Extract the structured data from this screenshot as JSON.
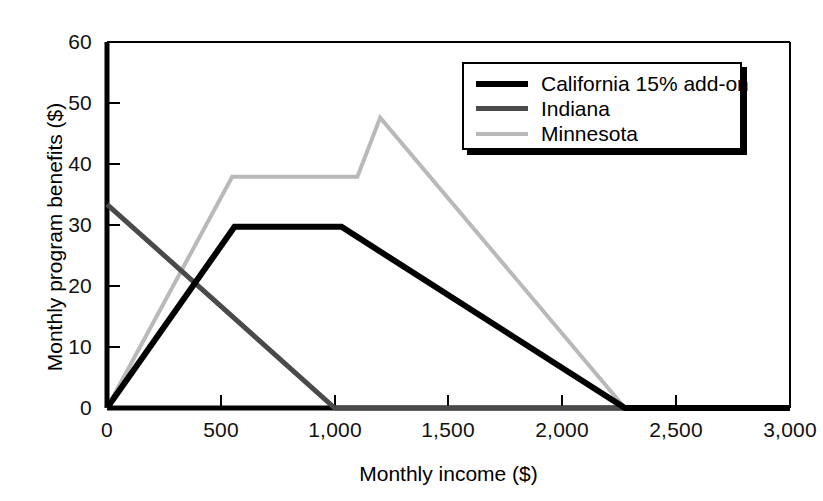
{
  "chart_data": {
    "type": "line",
    "title": "",
    "xlabel": "Monthly income ($)",
    "ylabel": "Monthly program benefits ($)",
    "xlim": [
      0,
      3000
    ],
    "ylim": [
      0,
      60
    ],
    "xticks": [
      0,
      500,
      1000,
      1500,
      2000,
      2500,
      3000
    ],
    "xtick_labels": [
      "0",
      "500",
      "1,000",
      "1,500",
      "2,000",
      "2,500",
      "3,000"
    ],
    "yticks": [
      0,
      10,
      20,
      30,
      40,
      50,
      60
    ],
    "ytick_labels": [
      "0",
      "10",
      "20",
      "30",
      "40",
      "50",
      "60"
    ],
    "grid": false,
    "legend_position": "upper right",
    "series": [
      {
        "name": "California 15% add-on",
        "color": "#000000",
        "width": 6,
        "x": [
          0,
          560,
          1030,
          2275,
          3000
        ],
        "y": [
          0,
          29.7,
          29.7,
          0,
          0
        ]
      },
      {
        "name": "Indiana",
        "color": "#4a4a4a",
        "width": 5,
        "x": [
          0,
          1000,
          3000
        ],
        "y": [
          33.4,
          0,
          0
        ]
      },
      {
        "name": "Minnesota",
        "color": "#b9b9b9",
        "width": 4,
        "x": [
          0,
          550,
          1100,
          1200,
          2275,
          3000
        ],
        "y": [
          0,
          37.9,
          37.9,
          47.6,
          0,
          0
        ]
      }
    ]
  },
  "legend": {
    "items": [
      {
        "label": "California 15% add-on"
      },
      {
        "label": "Indiana"
      },
      {
        "label": "Minnesota"
      }
    ]
  }
}
